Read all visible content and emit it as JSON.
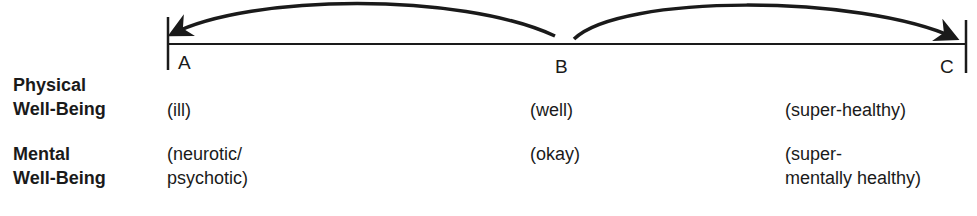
{
  "points": [
    {
      "id": "A",
      "label": "A"
    },
    {
      "id": "B",
      "label": "B"
    },
    {
      "id": "C",
      "label": "C"
    }
  ],
  "arrows": [
    {
      "from": "B",
      "to": "A",
      "direction": "left"
    },
    {
      "from": "B",
      "to": "C",
      "direction": "right"
    }
  ],
  "rows": [
    {
      "heading_line1": "Physical",
      "heading_line2": "Well-Being",
      "A": "(ill)",
      "B": "(well)",
      "C": "(super-healthy)"
    },
    {
      "heading_line1": "Mental",
      "heading_line2": "Well-Being",
      "A_line1": "(neurotic/",
      "A_line2": "psychotic)",
      "B": "(okay)",
      "C_line1": "(super-",
      "C_line2": "mentally healthy)"
    }
  ],
  "colors": {
    "ink": "#1a1a1a",
    "background": "#ffffff"
  }
}
